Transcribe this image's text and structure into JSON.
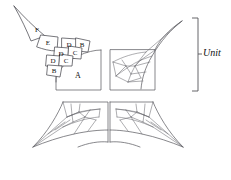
{
  "figure": {
    "background_color": "#ffffff",
    "line_color": "#55555a",
    "text_color": "#111111",
    "annotation": {
      "unit_label": "Unit",
      "bracket": "right-vertical-bracket"
    },
    "quadrant_labels": {
      "main": "A"
    },
    "exploded_pieces": [
      {
        "id": "p-f",
        "label": "F",
        "cx": 37,
        "cy": 30
      },
      {
        "id": "p-e",
        "label": "E",
        "cx": 48,
        "cy": 43
      },
      {
        "id": "p-d1",
        "label": "D",
        "cx": 69,
        "cy": 45
      },
      {
        "id": "p-b1",
        "label": "B",
        "cx": 82,
        "cy": 44
      },
      {
        "id": "p-d2",
        "label": "D",
        "cx": 61,
        "cy": 53
      },
      {
        "id": "p-c1",
        "label": "C",
        "cx": 75,
        "cy": 52
      },
      {
        "id": "p-d3",
        "label": "D",
        "cx": 53,
        "cy": 61
      },
      {
        "id": "p-c2",
        "label": "C",
        "cx": 66,
        "cy": 60
      },
      {
        "id": "p-b2",
        "label": "B",
        "cx": 54,
        "cy": 71
      }
    ],
    "quadrants": [
      {
        "id": "q-top-left",
        "name": "top-left-quadrant",
        "contains_label": "A"
      },
      {
        "id": "q-top-right",
        "name": "top-right-quadrant",
        "contains_label": ""
      },
      {
        "id": "q-bottom-left",
        "name": "bottom-left-quadrant",
        "contains_label": ""
      },
      {
        "id": "q-bottom-right",
        "name": "bottom-right-quadrant",
        "contains_label": ""
      }
    ]
  }
}
